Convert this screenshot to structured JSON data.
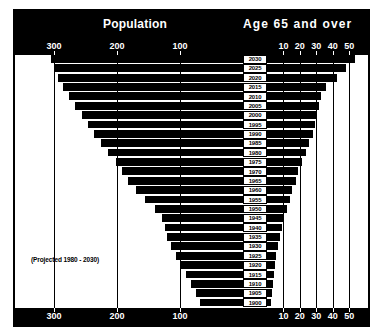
{
  "header": {
    "population_label": "Population",
    "age_label": "Age 65 and over"
  },
  "notes": {
    "projected": "(Projected 1980 - 2030)"
  },
  "chart_data": {
    "type": "bar",
    "orientation": "horizontal-pyramid",
    "xlabel_left": "Population",
    "xlabel_right": "Age 65 and over",
    "ylabel": "Year",
    "left_axis": {
      "ticks": [
        300,
        200,
        100
      ],
      "tick_labels": [
        "300",
        "200",
        "100"
      ],
      "max": 330,
      "direction": "right-to-left"
    },
    "right_axis": {
      "ticks": [
        10,
        20,
        30,
        40,
        50
      ],
      "tick_labels": [
        "10",
        "20",
        "30",
        "40",
        "50"
      ],
      "max": 56,
      "direction": "left-to-right"
    },
    "categories": [
      "2030",
      "2025",
      "2020",
      "2015",
      "2010",
      "2005",
      "2000",
      "1995",
      "1990",
      "1985",
      "1980",
      "1975",
      "1970",
      "1965",
      "1960",
      "1955",
      "1950",
      "1945",
      "1940",
      "1935",
      "1930",
      "1925",
      "1920",
      "1915",
      "1910",
      "1905",
      "1900"
    ],
    "series": [
      {
        "name": "Population",
        "side": "left",
        "units": "millions",
        "values": [
          305,
          300,
          293,
          285,
          276,
          266,
          256,
          246,
          236,
          226,
          214,
          202,
          192,
          182,
          170,
          156,
          140,
          129,
          124,
          120,
          115,
          107,
          98,
          90,
          83,
          75,
          68
        ]
      },
      {
        "name": "Age 65 and over",
        "side": "right",
        "units": "millions",
        "values": [
          53.5,
          48.0,
          42.8,
          36.2,
          32.6,
          31.8,
          30.5,
          29.0,
          27.7,
          25.7,
          23.5,
          21.2,
          19.0,
          17.5,
          15.5,
          13.8,
          12.0,
          10.6,
          9.0,
          7.8,
          6.6,
          5.6,
          4.6,
          4.0,
          3.4,
          2.9,
          2.5
        ]
      }
    ],
    "grid": true,
    "legend": "none",
    "annotations": [
      "(Projected 1980 - 2030)"
    ]
  }
}
